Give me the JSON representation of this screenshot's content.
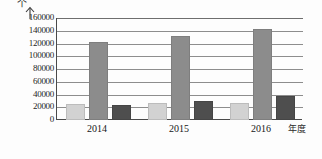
{
  "chart_data": {
    "type": "bar",
    "title": "",
    "subtitle": "",
    "unit_label": "个",
    "xlabel": "年度",
    "ylabel": "",
    "categories": [
      "2014",
      "2015",
      "2016"
    ],
    "ylim": [
      0,
      160000
    ],
    "yticks": [
      0,
      20000,
      40000,
      60000,
      80000,
      100000,
      120000,
      140000,
      160000
    ],
    "ytick_labels": [
      "0",
      "20000",
      "40000",
      "60000",
      "80000",
      "100000",
      "120000",
      "140000",
      "160000"
    ],
    "grid": true,
    "legend": "none",
    "series": [
      {
        "name": "series-1",
        "color": "#d2d2d2",
        "values": [
          22000,
          23000,
          23000
        ]
      },
      {
        "name": "series-2",
        "color": "#8c8c8c",
        "values": [
          120000,
          129000,
          140000
        ]
      },
      {
        "name": "series-3",
        "color": "#4e4e4e",
        "values": [
          20000,
          26000,
          35000
        ]
      }
    ]
  },
  "axis": {
    "arrow_icon": "up-arrow-icon"
  }
}
